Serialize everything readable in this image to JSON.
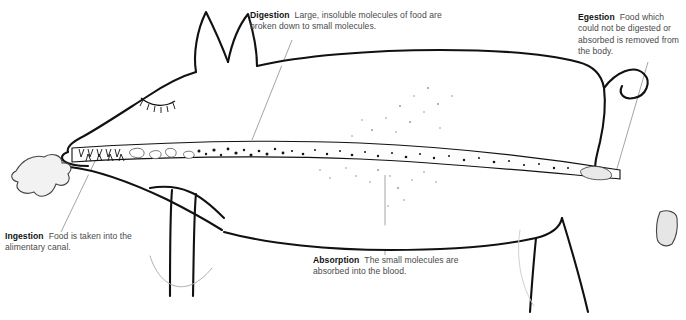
{
  "diagram": {
    "background_color": "#ffffff",
    "ink_color": "#111111",
    "leader_color": "#8a8a8a"
  },
  "callouts": {
    "digestion": {
      "term": "Digestion",
      "body": "Large, insoluble molecules of food are broken down to small molecules."
    },
    "egestion": {
      "term": "Egestion",
      "body": "Food which could not be digested or absorbed is removed from the body."
    },
    "ingestion": {
      "term": "Ingestion",
      "body": "Food is taken into the alimentary canal."
    },
    "absorption": {
      "term": "Absorption",
      "body": "The small molecules are absorbed into the blood."
    }
  },
  "features": {
    "food_bolus_label": "food-bolus",
    "faeces_label": "faecal-pellet",
    "alimentary_canal_label": "alimentary-canal",
    "teeth_label": "teeth",
    "eye_label": "closed-eye",
    "tail_label": "curled-tail"
  }
}
